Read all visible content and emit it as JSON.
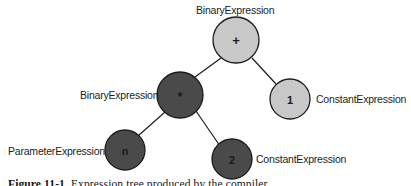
{
  "figure": {
    "kind": "expression-tree-diagram",
    "background_color": "#ffffff",
    "caption_label": "Figure 11-1.",
    "caption_text": "  Expression tree produced by the compiler"
  },
  "palette": {
    "node_light_fill": "#c8c8c8",
    "node_dark_fill": "#4a4a4a",
    "node_stroke": "#1b1b1b",
    "edge_stroke": "#1b1b1b",
    "label_text": "#1d1d1d",
    "node_text": "#1b1b1b"
  },
  "tree": {
    "nodes": [
      {
        "id": "root-add",
        "value": "+",
        "type_label": "BinaryExpression",
        "fill": "light",
        "cx": 236,
        "cy": 40,
        "r": 23,
        "label_position": "top"
      },
      {
        "id": "multiply",
        "value": "*",
        "type_label": "BinaryExpression",
        "fill": "dark",
        "cx": 180,
        "cy": 95,
        "r": 23,
        "label_position": "left"
      },
      {
        "id": "constant-one",
        "value": "1",
        "type_label": "ConstantExpression",
        "fill": "light",
        "cx": 290,
        "cy": 99,
        "r": 20,
        "label_position": "right"
      },
      {
        "id": "parameter-n",
        "value": "n",
        "type_label": "ParameterExpression",
        "fill": "dark",
        "cx": 125,
        "cy": 150,
        "r": 20,
        "label_position": "left"
      },
      {
        "id": "constant-two",
        "value": "2",
        "type_label": "ConstantExpression",
        "fill": "dark",
        "cx": 232,
        "cy": 159,
        "r": 20,
        "label_position": "right"
      }
    ],
    "edges": [
      {
        "from": "root-add",
        "to": "multiply"
      },
      {
        "from": "root-add",
        "to": "constant-one"
      },
      {
        "from": "multiply",
        "to": "parameter-n"
      },
      {
        "from": "multiply",
        "to": "constant-two"
      }
    ]
  },
  "labels": {
    "root_type": "BinaryExpression",
    "multiply_type": "BinaryExpression",
    "constant_one_type": "ConstantExpression",
    "parameter_type": "ParameterExpression",
    "constant_two_type": "ConstantExpression"
  },
  "values": {
    "root": "+",
    "multiply": "*",
    "constant_one": "1",
    "parameter": "n",
    "constant_two": "2"
  }
}
